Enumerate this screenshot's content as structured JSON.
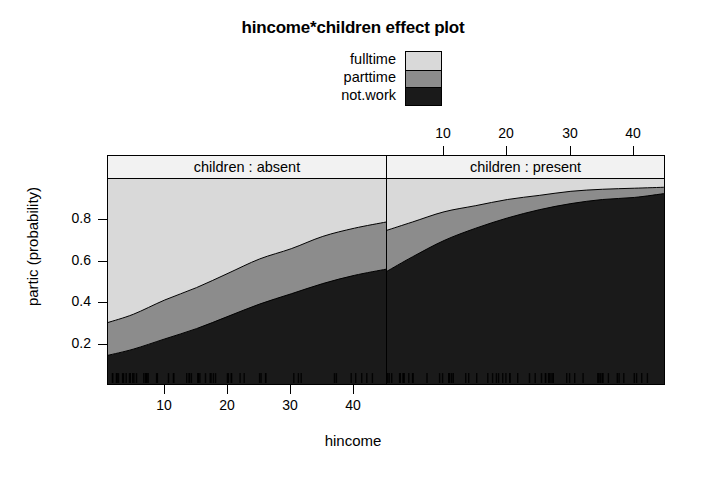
{
  "title": "hincome*children effect plot",
  "legend": {
    "items": [
      {
        "label": "fulltime",
        "color": "#d9d9d9"
      },
      {
        "label": "parttime",
        "color": "#8c8c8c"
      },
      {
        "label": "not.work",
        "color": "#1a1a1a"
      }
    ]
  },
  "axes": {
    "xlabel": "hincome",
    "ylabel": "partic (probability)",
    "x_ticks_bottom": [
      "10",
      "20",
      "30",
      "40"
    ],
    "x_ticks_top": [
      "10",
      "20",
      "30",
      "40"
    ],
    "y_ticks": [
      "0.8",
      "0.6",
      "0.4",
      "0.2"
    ]
  },
  "panels": [
    {
      "strip_label": "children : absent"
    },
    {
      "strip_label": "children : present"
    }
  ],
  "chart_data": {
    "type": "area",
    "title": "hincome*children effect plot",
    "xlabel": "hincome",
    "ylabel": "partic (probability)",
    "ylim": [
      0,
      1
    ],
    "xlim": [
      1,
      45
    ],
    "grid": false,
    "legend_position": "top-center",
    "stacked": true,
    "stack_order_bottom_to_top": [
      "not.work",
      "parttime",
      "fulltime"
    ],
    "colors": {
      "fulltime": "#d9d9d9",
      "parttime": "#8c8c8c",
      "not.work": "#1a1a1a"
    },
    "facets": [
      {
        "name": "children : absent",
        "x": [
          1,
          5,
          10,
          15,
          20,
          25,
          30,
          35,
          40,
          45
        ],
        "series": [
          {
            "name": "not.work",
            "values": [
              0.14,
              0.17,
              0.22,
              0.27,
              0.33,
              0.39,
              0.44,
              0.49,
              0.53,
              0.56
            ]
          },
          {
            "name": "parttime",
            "values": [
              0.16,
              0.17,
              0.19,
              0.2,
              0.21,
              0.22,
              0.22,
              0.23,
              0.23,
              0.23
            ]
          },
          {
            "name": "fulltime",
            "values": [
              0.7,
              0.66,
              0.59,
              0.53,
              0.46,
              0.39,
              0.34,
              0.28,
              0.24,
              0.21
            ]
          }
        ],
        "cumulative_not_work": [
          0.14,
          0.17,
          0.22,
          0.27,
          0.33,
          0.39,
          0.44,
          0.49,
          0.53,
          0.56
        ],
        "cumulative_not_work_plus_parttime": [
          0.3,
          0.34,
          0.41,
          0.47,
          0.54,
          0.61,
          0.66,
          0.72,
          0.76,
          0.79
        ]
      },
      {
        "name": "children : present",
        "x": [
          1,
          5,
          10,
          15,
          20,
          25,
          30,
          35,
          40,
          45
        ],
        "series": [
          {
            "name": "not.work",
            "values": [
              0.55,
              0.62,
              0.7,
              0.76,
              0.81,
              0.85,
              0.88,
              0.9,
              0.91,
              0.93
            ]
          },
          {
            "name": "parttime",
            "values": [
              0.2,
              0.17,
              0.14,
              0.11,
              0.09,
              0.07,
              0.06,
              0.05,
              0.04,
              0.03
            ]
          },
          {
            "name": "fulltime",
            "values": [
              0.25,
              0.21,
              0.16,
              0.13,
              0.1,
              0.08,
              0.06,
              0.05,
              0.05,
              0.04
            ]
          }
        ],
        "cumulative_not_work": [
          0.55,
          0.62,
          0.7,
          0.76,
          0.81,
          0.85,
          0.88,
          0.9,
          0.91,
          0.93
        ],
        "cumulative_not_work_plus_parttime": [
          0.75,
          0.79,
          0.84,
          0.87,
          0.9,
          0.92,
          0.94,
          0.95,
          0.955,
          0.96
        ]
      }
    ],
    "rug": true
  }
}
